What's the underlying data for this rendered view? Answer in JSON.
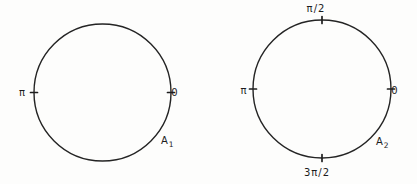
{
  "figure": {
    "background_color": "#fdfdfc",
    "line_color": "#242424",
    "text_color": "#1c1c1c",
    "circles": [
      {
        "id": "circle-1",
        "cx": 102.5,
        "cy": 92.5,
        "r": 68.5,
        "ticks": [
          {
            "angle_deg": 180,
            "label": "π",
            "label_x": 22.5,
            "label_y": 95.5
          },
          {
            "angle_deg": 0,
            "label": "0",
            "label_x": 175,
            "label_y": 95.5
          }
        ],
        "region_label": {
          "base": "A",
          "subscript": "1",
          "x": 161,
          "y": 144
        }
      },
      {
        "id": "circle-2",
        "cx": 322,
        "cy": 89,
        "r": 69,
        "ticks": [
          {
            "angle_deg": 90,
            "label": "π/2",
            "label_x": 316,
            "label_y": 11.5
          },
          {
            "angle_deg": 180,
            "label": "π",
            "label_x": 244,
            "label_y": 93.5
          },
          {
            "angle_deg": 0,
            "label": "0",
            "label_x": 395,
            "label_y": 93.5
          },
          {
            "angle_deg": 270,
            "label": "3π/2",
            "label_x": 317,
            "label_y": 176
          }
        ],
        "region_label": {
          "base": "A",
          "subscript": "2",
          "x": 376,
          "y": 145
        }
      }
    ]
  }
}
